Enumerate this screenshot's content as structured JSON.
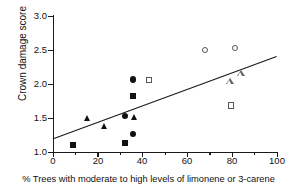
{
  "chart_data": {
    "type": "scatter",
    "title": "",
    "xlabel": "% Trees with moderate to high levels of limonene or 3-carene",
    "ylabel": "Crown damage score",
    "xlim": [
      0,
      100
    ],
    "ylim": [
      1.0,
      3.0
    ],
    "xticks": [
      0,
      20,
      40,
      60,
      80,
      100
    ],
    "xtick_labels": [
      "0",
      "20",
      "40",
      "60",
      "80",
      "100"
    ],
    "xticks_minor": [
      10,
      30,
      50,
      70,
      90
    ],
    "yticks": [
      1.0,
      1.5,
      2.0,
      2.5,
      3.0
    ],
    "ytick_labels": [
      "1.0",
      "1.5",
      "2.0",
      "2.5",
      "3.0"
    ],
    "grid": false,
    "legend": "none",
    "series": [
      {
        "name": "filled-circle",
        "marker": "circle-filled",
        "points": [
          {
            "x": 35.7,
            "y": 2.06
          },
          {
            "x": 35.7,
            "y": 1.26
          },
          {
            "x": 32.1,
            "y": 1.52
          }
        ]
      },
      {
        "name": "filled-square",
        "marker": "square-filled",
        "points": [
          {
            "x": 8.9,
            "y": 1.1
          },
          {
            "x": 35.7,
            "y": 1.82
          },
          {
            "x": 32.1,
            "y": 1.13
          }
        ]
      },
      {
        "name": "filled-triangle",
        "marker": "triangle-filled",
        "points": [
          {
            "x": 15.2,
            "y": 1.5
          },
          {
            "x": 22.8,
            "y": 1.37
          },
          {
            "x": 36.2,
            "y": 1.51
          }
        ]
      },
      {
        "name": "open-circle",
        "marker": "circle-open",
        "points": [
          {
            "x": 67.9,
            "y": 2.5
          },
          {
            "x": 81.3,
            "y": 2.53
          }
        ]
      },
      {
        "name": "open-square",
        "marker": "square-open",
        "points": [
          {
            "x": 42.9,
            "y": 2.06
          },
          {
            "x": 79.5,
            "y": 1.68
          }
        ]
      },
      {
        "name": "open-triangle",
        "marker": "triangle-open",
        "points": [
          {
            "x": 79.0,
            "y": 2.03
          },
          {
            "x": 84.0,
            "y": 2.15
          }
        ]
      }
    ],
    "fit_line": {
      "type": "linear-regression",
      "x_start": 0,
      "y_start": 1.19,
      "x_end": 100,
      "y_end": 2.4
    }
  }
}
